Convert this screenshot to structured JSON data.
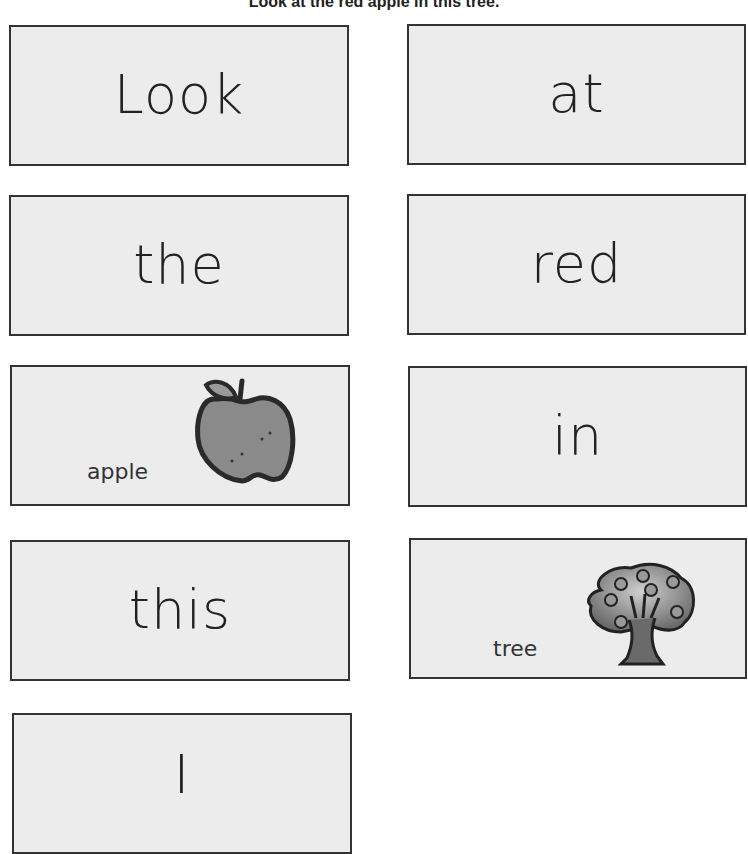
{
  "heading": "Look at the red apple in this tree.",
  "cards": [
    {
      "word": "Look"
    },
    {
      "word": "at"
    },
    {
      "word": "the"
    },
    {
      "word": "red"
    },
    {
      "word": "apple",
      "picture": "apple-icon"
    },
    {
      "word": "in"
    },
    {
      "word": "this"
    },
    {
      "word": "tree",
      "picture": "tree-icon"
    },
    {
      "word": "I"
    }
  ]
}
